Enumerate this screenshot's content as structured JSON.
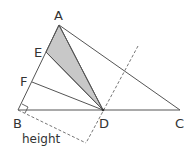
{
  "diagram": {
    "type": "triangle-area-geometry",
    "points": {
      "A": {
        "label": "A",
        "x": 59,
        "y": 25
      },
      "B": {
        "label": "B",
        "x": 18,
        "y": 110
      },
      "C": {
        "label": "C",
        "x": 180,
        "y": 110
      },
      "D": {
        "label": "D",
        "x": 103,
        "y": 110
      },
      "E": {
        "label": "E",
        "x": 46,
        "y": 52
      },
      "F": {
        "label": "F",
        "x": 32,
        "y": 82
      }
    },
    "shaded_region": "triangle AED",
    "height_label": "height",
    "colors": {
      "line": "#555555",
      "shade": "#c8c8c8",
      "dashed": "#666666"
    }
  }
}
